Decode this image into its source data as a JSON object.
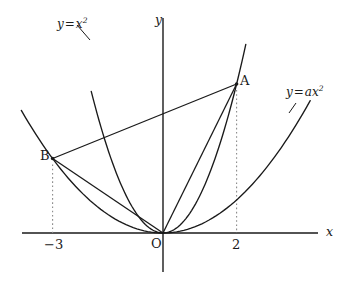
{
  "figure": {
    "kind": "coordinate-plane-diagram",
    "background_color": "#ffffff",
    "stroke_color": "#1a1a1a",
    "dotted_color": "#7a7a7a",
    "width": 348,
    "height": 287
  },
  "axes": {
    "x_label": "x",
    "y_label": "y",
    "origin_label": "O",
    "origin_px": {
      "x": 163,
      "y": 233
    },
    "x_axis_px": {
      "x1": 22,
      "y1": 233,
      "x2": 318,
      "y2": 233
    },
    "y_axis_px": {
      "x1": 163,
      "y1": 18,
      "x2": 163,
      "y2": 272
    },
    "units_per_px_x": 36.8,
    "units_per_px_y": 37.25
  },
  "ticks": [
    {
      "name": "tick-minus-3",
      "label": "-3",
      "display": "−3",
      "value": -3,
      "px_x": 57
    },
    {
      "name": "tick-2",
      "label": "2",
      "display": "2",
      "value": 2,
      "px_x": 237
    }
  ],
  "curves": [
    {
      "name": "parabola-y-equals-x-squared",
      "label_parts": {
        "lhs": "y",
        "op": "=",
        "rhs": "x",
        "exponent": "2"
      },
      "label_text": "y = x²",
      "equation": "y = x^2",
      "coefficient": 1,
      "x_range": [
        -1.95,
        2.25
      ]
    },
    {
      "name": "parabola-y-equals-a-x-squared",
      "label_parts": {
        "lhs": "y",
        "op": "=",
        "rhs": "ax",
        "exponent": "2"
      },
      "label_text": "y = ax²",
      "equation": "y = a x^2",
      "coefficient": 0.222,
      "x_range": [
        -3.85,
        4.0
      ]
    }
  ],
  "points": [
    {
      "name": "point-a",
      "label": "A",
      "x": 2,
      "y": 4,
      "px": {
        "x": 237,
        "y": 84
      },
      "on_curve": "parabola-y-equals-x-squared"
    },
    {
      "name": "point-b",
      "label": "B",
      "x": -3,
      "y": 2,
      "px": {
        "x": 57,
        "y": 158
      },
      "on_curve": "parabola-y-equals-a-x-squared"
    },
    {
      "name": "point-o",
      "label": "O",
      "x": 0,
      "y": 0,
      "px": {
        "x": 163,
        "y": 233
      },
      "on_curve": "both"
    }
  ],
  "segments": [
    {
      "name": "segment-ab",
      "from": "point-b",
      "to": "point-a"
    },
    {
      "name": "segment-ao",
      "from": "point-a",
      "to": "point-o"
    },
    {
      "name": "segment-bo",
      "from": "point-b",
      "to": "point-o"
    }
  ],
  "guides": [
    {
      "name": "dotted-guide-a",
      "from_point": "point-a",
      "px_x": 237,
      "px_y_top": 90,
      "px_y_bottom": 233
    },
    {
      "name": "dotted-guide-b",
      "from_point": "point-b",
      "px_x": 57,
      "px_y_top": 163,
      "px_y_bottom": 233
    }
  ],
  "leaders": [
    {
      "name": "leader-y-equals-x-squared",
      "x1": 90,
      "y1": 40,
      "x2": 77,
      "y2": 25
    },
    {
      "name": "leader-y-equals-a-x-squared",
      "x1": 289,
      "y1": 113,
      "x2": 296,
      "y2": 103
    }
  ],
  "label_positions": {
    "eq_x_squared": {
      "left": 57,
      "top": 18
    },
    "eq_ax_squared": {
      "left": 286,
      "top": 86
    },
    "point_a": {
      "left": 240,
      "top": 74
    },
    "point_b": {
      "left": 40,
      "top": 149
    },
    "origin": {
      "left": 151,
      "top": 237
    },
    "axis_x": {
      "left": 326,
      "top": 226
    },
    "axis_y": {
      "left": 155,
      "top": 14
    },
    "tick_minus_3": {
      "left": 44,
      "top": 238
    },
    "tick_2": {
      "left": 232,
      "top": 238
    }
  },
  "chart_data": {
    "type": "line",
    "title": "",
    "xlabel": "x",
    "ylabel": "y",
    "xlim": [
      -4.0,
      4.2
    ],
    "ylim": [
      -0.6,
      5.8
    ],
    "grid": false,
    "legend": "inline-curve-labels",
    "series": [
      {
        "name": "y = x²",
        "equation": "y = x^2",
        "x": [
          -1.95,
          -1.5,
          -1.0,
          -0.5,
          0,
          0.5,
          1.0,
          1.5,
          2.0,
          2.25
        ],
        "values": [
          3.8,
          2.25,
          1.0,
          0.25,
          0,
          0.25,
          1.0,
          2.25,
          4.0,
          5.06
        ]
      },
      {
        "name": "y = ax²",
        "equation": "y = 0.222 x^2",
        "x": [
          -3.85,
          -3.0,
          -2.0,
          -1.0,
          0,
          1.0,
          2.0,
          3.0,
          4.0
        ],
        "values": [
          3.29,
          2.0,
          0.89,
          0.22,
          0,
          0.22,
          0.89,
          2.0,
          3.55
        ]
      }
    ],
    "annotations": [
      {
        "label": "A",
        "x": 2,
        "y": 4
      },
      {
        "label": "B",
        "x": -3,
        "y": 2
      },
      {
        "label": "O",
        "x": 0,
        "y": 0
      }
    ]
  }
}
